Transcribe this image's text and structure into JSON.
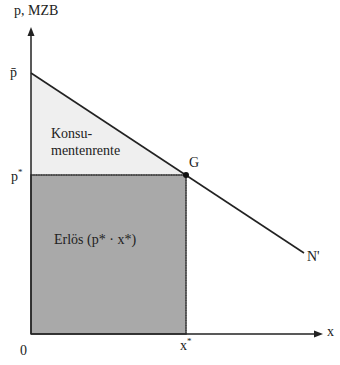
{
  "diagram": {
    "type": "economics-demand-diagram",
    "axes": {
      "y_label": "p, MZB",
      "x_label": "x",
      "origin_label": "0"
    },
    "ticks": {
      "p_bar": "p̄",
      "p_star": "p",
      "p_star_sup": "*",
      "x_star": "x",
      "x_star_sup": "*"
    },
    "points": {
      "equilibrium": "G",
      "demand_curve": "N'"
    },
    "areas": {
      "consumer_surplus_line1": "Konsu-",
      "consumer_surplus_line2": "mentenrente",
      "revenue": "Erlös (p* · x*)"
    },
    "colors": {
      "consumer_surplus_fill": "#efefef",
      "revenue_fill": "#a9a9a9",
      "line": "#222222"
    }
  }
}
